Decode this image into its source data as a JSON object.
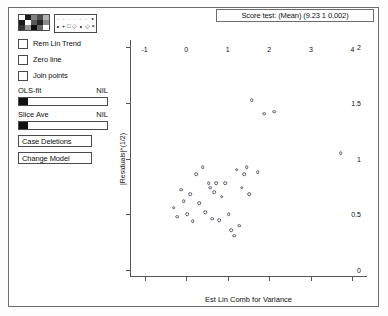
{
  "window": {
    "title": ""
  },
  "score_test": {
    "text": "Score test: (Mean)  (9.23 1 0.002)"
  },
  "palettes": {
    "color_swatches": [
      "#ffffff",
      "#1a1a1a",
      "#808080",
      "#4d4d4d",
      "#b3b3b3",
      "#1a1a1a",
      "#ffffff",
      "#595959",
      "#262626",
      "#8c8c8c",
      "#333333",
      "#999999",
      "#0d0d0d",
      "#666666",
      "#ffffff"
    ],
    "symbols_top": [
      "·",
      "·",
      "·",
      "·",
      "·",
      "·",
      "∘"
    ],
    "symbols_bottom": [
      "∘",
      "+",
      "□",
      "◇",
      "∘",
      "◇",
      "×"
    ]
  },
  "checkboxes": [
    {
      "label": "Rem Lin Trend",
      "checked": false
    },
    {
      "label": "Zero line",
      "checked": false
    },
    {
      "label": "Join points",
      "checked": false
    }
  ],
  "sliders": [
    {
      "label": "OLS-fit",
      "value": "NIL"
    },
    {
      "label": "Slice Ave",
      "value": "NIL"
    }
  ],
  "buttons": [
    {
      "label": "Case Deletions"
    },
    {
      "label": "Change Model"
    }
  ],
  "chart_data": {
    "type": "scatter",
    "title": "",
    "xlabel": "Est Lin Comb for Variance",
    "ylabel": "|Residuals|^(1/2)",
    "xlim": [
      -1.35,
      4.35
    ],
    "ylim": [
      -0.06,
      2.06
    ],
    "xticks": [
      -1,
      0,
      1,
      2,
      3,
      4
    ],
    "yticks": [
      0,
      0.5,
      1,
      1.5,
      2
    ],
    "xtick_labels": [
      "-1",
      "0",
      "1",
      "2",
      "3",
      "4"
    ],
    "ytick_labels": [
      "0",
      "0.5",
      "1",
      "1.5",
      "2"
    ],
    "grid": false,
    "legend": "none",
    "marker": "open-circle",
    "marker_color": "#5c5c6a",
    "points": [
      {
        "x": -0.3,
        "y": 0.56
      },
      {
        "x": -0.22,
        "y": 0.48
      },
      {
        "x": -0.12,
        "y": 0.72
      },
      {
        "x": -0.06,
        "y": 0.62
      },
      {
        "x": 0.02,
        "y": 0.5
      },
      {
        "x": 0.1,
        "y": 0.68
      },
      {
        "x": 0.16,
        "y": 0.44
      },
      {
        "x": 0.24,
        "y": 0.86
      },
      {
        "x": 0.32,
        "y": 0.6
      },
      {
        "x": 0.4,
        "y": 0.92
      },
      {
        "x": 0.46,
        "y": 0.52
      },
      {
        "x": 0.54,
        "y": 0.78
      },
      {
        "x": 0.58,
        "y": 0.74
      },
      {
        "x": 0.62,
        "y": 0.46
      },
      {
        "x": 0.68,
        "y": 0.7
      },
      {
        "x": 0.72,
        "y": 0.78
      },
      {
        "x": 0.8,
        "y": 0.45
      },
      {
        "x": 0.86,
        "y": 0.66
      },
      {
        "x": 0.94,
        "y": 0.78
      },
      {
        "x": 1.02,
        "y": 0.5
      },
      {
        "x": 1.08,
        "y": 0.36
      },
      {
        "x": 1.16,
        "y": 0.31
      },
      {
        "x": 1.22,
        "y": 0.9
      },
      {
        "x": 1.28,
        "y": 0.4
      },
      {
        "x": 1.34,
        "y": 0.74
      },
      {
        "x": 1.4,
        "y": 0.86
      },
      {
        "x": 1.46,
        "y": 0.92
      },
      {
        "x": 1.52,
        "y": 0.68
      },
      {
        "x": 1.58,
        "y": 1.52
      },
      {
        "x": 1.72,
        "y": 0.88
      },
      {
        "x": 1.88,
        "y": 1.4
      },
      {
        "x": 2.12,
        "y": 1.42
      },
      {
        "x": 3.72,
        "y": 1.05
      }
    ]
  }
}
